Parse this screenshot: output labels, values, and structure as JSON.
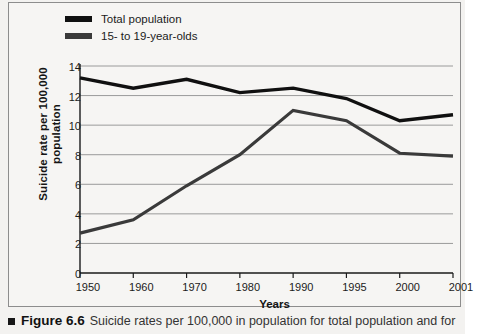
{
  "figure": {
    "caption_number": "Figure 6.6",
    "caption_text": "Suicide rates per 100,000 in population for total population and for",
    "marker_icon": "square-bullet-icon"
  },
  "legend": {
    "position": "top-left",
    "items": [
      {
        "label": "Total population",
        "color": "#101010"
      },
      {
        "label": "15- to 19-year-olds",
        "color": "#3a3a3a"
      }
    ]
  },
  "axes": {
    "y_title_line1": "Suicide rate per 100,000",
    "y_title_line2": "population",
    "x_title": "Years"
  },
  "chart_data": {
    "type": "line",
    "title": "",
    "xlabel": "Years",
    "ylabel": "Suicide rate per 100,000 population",
    "categories": [
      "1950",
      "1960",
      "1970",
      "1980",
      "1990",
      "1995",
      "2000",
      "2001"
    ],
    "yticks": [
      0,
      2,
      4,
      6,
      8,
      10,
      12,
      14
    ],
    "ylim": [
      0,
      14
    ],
    "grid": "horizontal",
    "legend_position": "top-left",
    "series": [
      {
        "name": "Total population",
        "color": "#101010",
        "values": [
          13.2,
          12.5,
          13.1,
          12.2,
          12.5,
          11.8,
          10.3,
          10.7
        ]
      },
      {
        "name": "15- to 19-year-olds",
        "color": "#3a3a3a",
        "values": [
          2.7,
          3.6,
          5.9,
          8.0,
          11.0,
          10.3,
          8.1,
          7.9
        ]
      }
    ]
  }
}
